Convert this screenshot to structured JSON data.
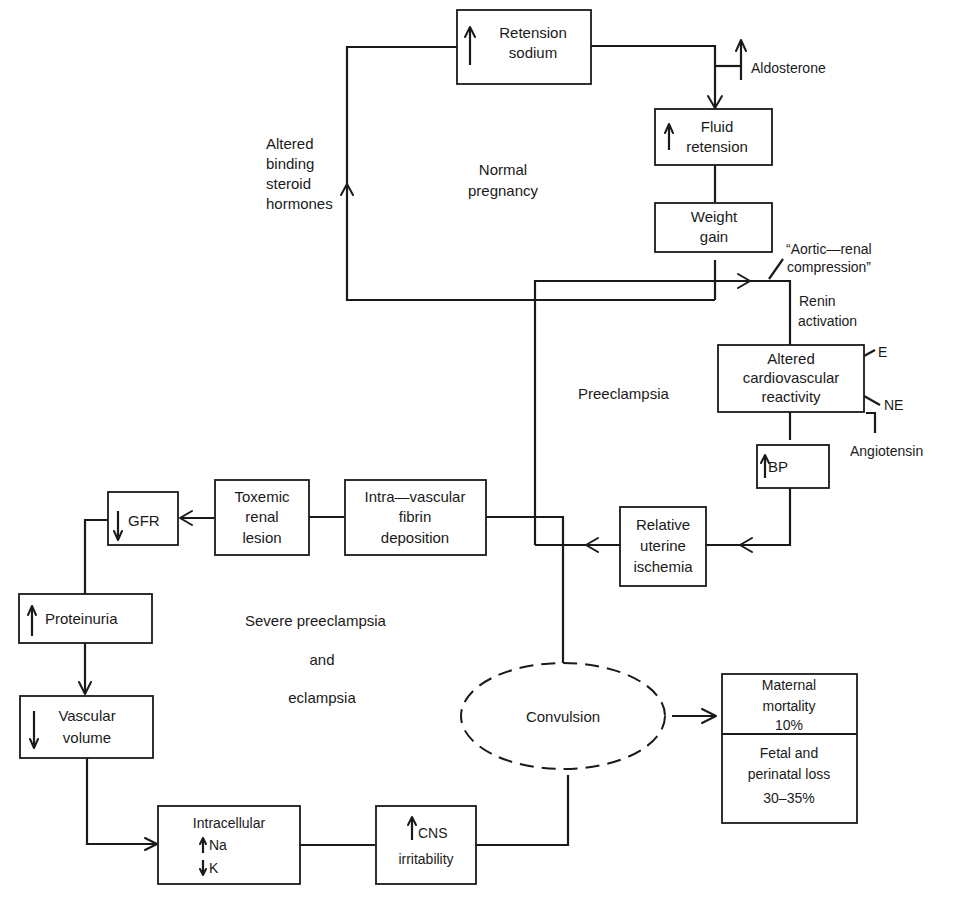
{
  "diagram": {
    "type": "flowchart",
    "regions": {
      "normal": "Normal",
      "normal2": "pregnancy",
      "preeclampsia": "Preeclampsia",
      "severe1": "Severe preeclampsia",
      "severe2": "and",
      "severe3": "eclampsia"
    },
    "nodes": {
      "retension_sodium": {
        "arrow": "up",
        "line1": "Retension",
        "line2": "sodium"
      },
      "fluid_retension": {
        "arrow": "up",
        "line1": "Fluid",
        "line2": "retension"
      },
      "weight_gain": {
        "line1": "Weight",
        "line2": "gain"
      },
      "altered_cv": {
        "line1": "Altered",
        "line2": "cardiovascular",
        "line3": "reactivity"
      },
      "bp": {
        "arrow": "up",
        "label": "BP"
      },
      "uterine_ischemia": {
        "line1": "Relative",
        "line2": "uterine",
        "line3": "ischemia"
      },
      "fibrin": {
        "line1": "Intra—vascular",
        "line2": "fibrin",
        "line3": "deposition"
      },
      "renal_lesion": {
        "line1": "Toxemic",
        "line2": "renal",
        "line3": "lesion"
      },
      "gfr": {
        "arrow": "down",
        "label": "GFR"
      },
      "proteinuria": {
        "arrow": "up",
        "label": "Proteinuria"
      },
      "vascular_volume": {
        "arrow": "down",
        "line1": "Vascular",
        "line2": "volume"
      },
      "intracellular": {
        "line1": "Intracellular",
        "na": "Na",
        "k": "K"
      },
      "cns": {
        "arrow": "up",
        "line1": "CNS",
        "line2": "irritability"
      },
      "convulsion": {
        "label": "Convulsion"
      },
      "outcome_maternal": {
        "line1": "Maternal",
        "line2": "mortality",
        "line3": "10%"
      },
      "outcome_fetal": {
        "line1": "Fetal and",
        "line2": "perinatal loss",
        "line3": "30–35%"
      }
    },
    "annotations": {
      "aldosterone": "Aldosterone",
      "steroid1": "Altered",
      "steroid2": "binding",
      "steroid3": "steroid",
      "steroid4": "hormones",
      "aortic1": "“Aortic—renal",
      "aortic2": "compression”",
      "renin1": "Renin",
      "renin2": "activation",
      "e": "E",
      "ne": "NE",
      "angiotensin": "Angiotensin"
    }
  }
}
